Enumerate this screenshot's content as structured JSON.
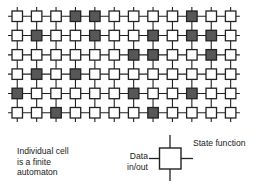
{
  "diagram": {
    "grid": {
      "rows": 6,
      "cols": 12,
      "dark_cells": [
        [
          4,
          5,
          10
        ],
        [
          2,
          5,
          8,
          10,
          11
        ],
        [
          7,
          8,
          11
        ],
        [
          2,
          4
        ],
        [
          1,
          7,
          10
        ],
        [
          3,
          8
        ]
      ]
    },
    "colors": {
      "line": "#222222",
      "dark_fill": "#575757",
      "light_fill": "#ffffff"
    },
    "caption": {
      "lines": [
        "Individual cell",
        "is a finite",
        "automaton"
      ]
    },
    "legend": {
      "state_label": "State function",
      "data_label_lines": [
        "Data",
        "in/out"
      ]
    }
  }
}
